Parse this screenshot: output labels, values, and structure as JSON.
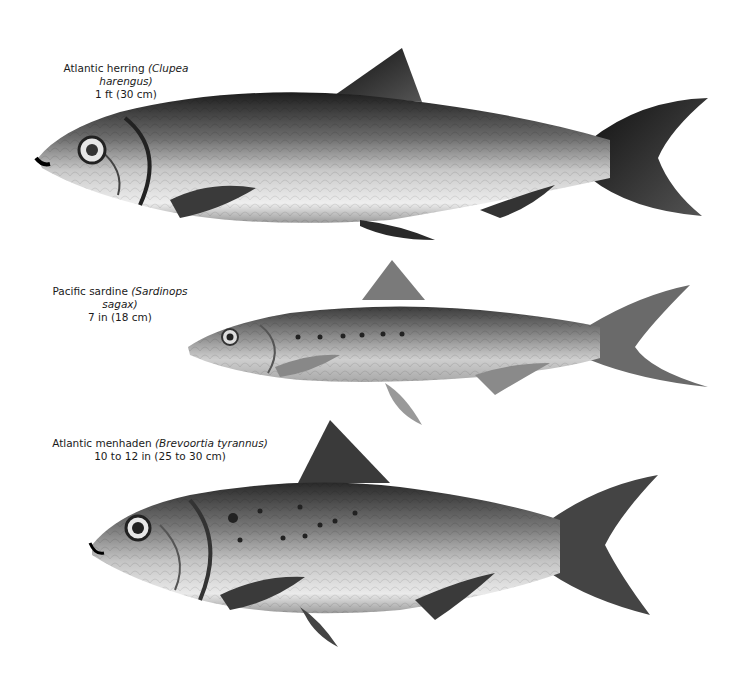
{
  "plate": {
    "background": "#ffffff",
    "figures": [
      {
        "common_name": "Atlantic herring",
        "scientific_name": "(Clupea harengus)",
        "size": "1 ft (30 cm)"
      },
      {
        "common_name": "Pacific sardine",
        "scientific_name": "(Sardinops sagax)",
        "size": "7 in (18 cm)"
      },
      {
        "common_name": "Atlantic menhaden",
        "scientific_name": "(Brevoortia tyrannus)",
        "size": "10 to 12 in (25 to 30 cm)"
      }
    ]
  }
}
